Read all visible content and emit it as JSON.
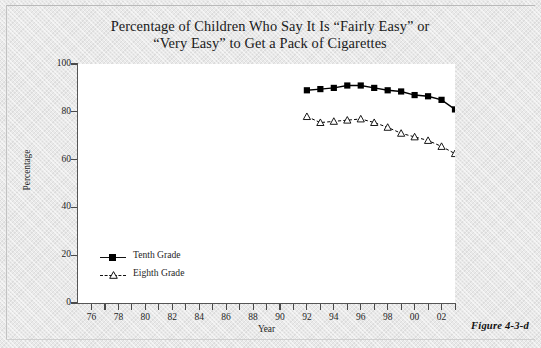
{
  "title": "Percentage of Children Who Say It Is “Fairly Easy” or\n“Very Easy” to Get a Pack of Cigarettes",
  "caption": "Figure 4-3-d",
  "axes": {
    "y_title": "Percentage",
    "x_title": "Year",
    "y_ticks": [
      "0",
      "20",
      "40",
      "60",
      "80",
      "100"
    ],
    "x_ticks": [
      "76",
      "78",
      "80",
      "82",
      "84",
      "86",
      "88",
      "90",
      "92",
      "94",
      "96",
      "98",
      "00",
      "02"
    ]
  },
  "legend": {
    "items": [
      {
        "label": "Tenth Grade",
        "marker": "filled-square",
        "line": "solid",
        "color": "#000000"
      },
      {
        "label": "Eighth Grade",
        "marker": "open-triangle",
        "line": "dashed",
        "color": "#000000"
      }
    ]
  },
  "chart_data": {
    "type": "line",
    "title": "Percentage of Children Who Say It Is “Fairly Easy” or “Very Easy” to Get a Pack of Cigarettes",
    "xlabel": "Year",
    "ylabel": "Percentage",
    "xlim": [
      1975,
      2003
    ],
    "ylim": [
      0,
      100
    ],
    "ytick_step": 20,
    "xtick_step": 1,
    "xtick_label_step": 2,
    "grid": false,
    "legend_position": "inside-lower-left",
    "x": [
      1992,
      1993,
      1994,
      1995,
      1996,
      1997,
      1998,
      1999,
      2000,
      2001,
      2002,
      2003
    ],
    "series": [
      {
        "name": "Tenth Grade",
        "marker": "filled-square",
        "line": "solid",
        "color": "#000000",
        "values": [
          89.0,
          89.5,
          90.0,
          91.0,
          91.0,
          90.0,
          89.0,
          88.5,
          87.0,
          86.5,
          85.0,
          81.0
        ]
      },
      {
        "name": "Eighth Grade",
        "marker": "open-triangle",
        "line": "dashed",
        "color": "#000000",
        "values": [
          78.0,
          75.5,
          76.0,
          76.5,
          77.0,
          75.5,
          73.5,
          71.0,
          69.5,
          68.0,
          65.5,
          62.5
        ]
      }
    ]
  }
}
